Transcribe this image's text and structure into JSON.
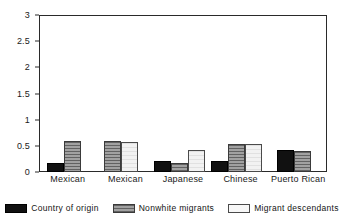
{
  "chart_data": {
    "type": "bar",
    "title": "",
    "subtitle": "",
    "xlabel": "",
    "ylabel": "",
    "categories": [
      "Mexican",
      "Mexican",
      "Japanese",
      "Chinese",
      "Puerto Rican"
    ],
    "series": [
      {
        "name": "Country of origin",
        "color": "#111111",
        "values": [
          0.18,
          null,
          0.21,
          0.21,
          0.43
        ]
      },
      {
        "name": "Nonwhite migrants",
        "color": "#8c8c8c",
        "values": [
          0.6,
          0.6,
          0.17,
          0.53,
          0.4
        ]
      },
      {
        "name": "Migrant descendants",
        "color": "#f2f2f2",
        "values": [
          null,
          0.58,
          0.42,
          0.53,
          null
        ]
      }
    ],
    "ylim": [
      0,
      3
    ],
    "yticks": [
      "0",
      "0.5",
      "1",
      "1.5",
      "2",
      "2.5",
      "3"
    ],
    "ytick_values": [
      0,
      0.5,
      1,
      1.5,
      2,
      2.5,
      3
    ],
    "grid": false,
    "legend_position": "bottom",
    "legend": [
      "Country of origin",
      "Nonwhite migrants",
      "Migrant descendants"
    ]
  }
}
